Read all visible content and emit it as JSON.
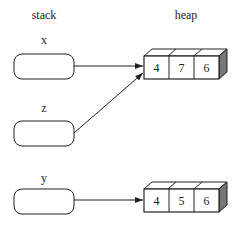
{
  "headers": {
    "stack": "stack",
    "heap": "heap"
  },
  "stack_vars": [
    {
      "name": "x",
      "label_y": 40,
      "box_y": 54
    },
    {
      "name": "z",
      "label_y": 108,
      "box_y": 121
    },
    {
      "name": "y",
      "label_y": 178,
      "box_y": 189
    }
  ],
  "heap_arrays": [
    {
      "values": [
        "4",
        "7",
        "6"
      ],
      "front_y": 56
    },
    {
      "values": [
        "4",
        "5",
        "6"
      ],
      "front_y": 189
    }
  ],
  "references": [
    {
      "from": "x",
      "to": 0
    },
    {
      "from": "z",
      "to": 0
    },
    {
      "from": "y",
      "to": 1
    }
  ],
  "colors": {
    "stroke": "#222222",
    "side_face": "#777777"
  }
}
